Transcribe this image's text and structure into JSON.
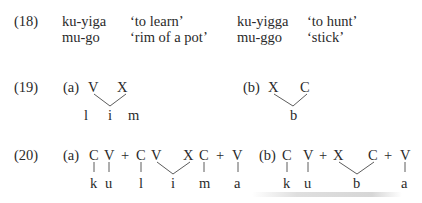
{
  "ex18": {
    "number": "(18)",
    "rows": [
      {
        "word1": "ku-yiga",
        "gloss1": "‘to learn’",
        "word2": "ku-yigga",
        "gloss2": "‘to hunt’"
      },
      {
        "word1": "mu-go",
        "gloss1": "‘rim of a pot’",
        "word2": "mu-ggo",
        "gloss2": "‘stick’"
      }
    ]
  },
  "ex19": {
    "number": "(19)",
    "a": {
      "label": "(a)",
      "tier_top": [
        "V",
        "X"
      ],
      "tier_bottom": [
        "l",
        "i",
        "m"
      ]
    },
    "b": {
      "label": "(b)",
      "tier_top": [
        "X",
        "C"
      ],
      "tier_bottom": [
        "b"
      ]
    }
  },
  "ex20": {
    "number": "(20)",
    "a": {
      "label": "(a)",
      "tier_top": [
        "C",
        "V",
        "+",
        "C",
        "V",
        "X",
        "C",
        "+",
        "V"
      ],
      "tier_bottom": [
        "k",
        "u",
        "l",
        "i",
        "m",
        "a"
      ]
    },
    "b": {
      "label": "(b)",
      "tier_top": [
        "C",
        "V",
        "+",
        "X",
        "C",
        "+",
        "V"
      ],
      "tier_bottom": [
        "k",
        "u",
        "b",
        "a"
      ]
    }
  }
}
